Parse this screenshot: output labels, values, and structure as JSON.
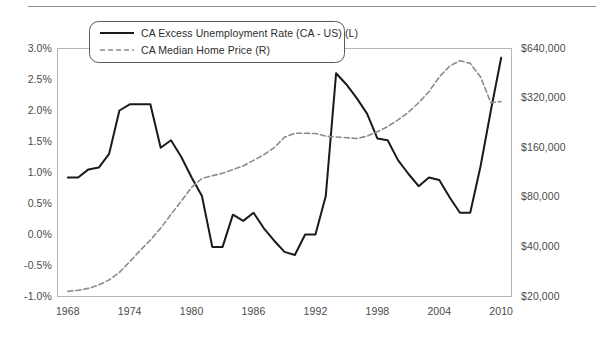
{
  "chart_data": {
    "type": "line",
    "title": "",
    "subtitle": "",
    "xlabel": "",
    "ylabel": "",
    "grid": false,
    "legend_position": "top-left",
    "x": [
      1968,
      1969,
      1970,
      1971,
      1972,
      1973,
      1974,
      1975,
      1976,
      1977,
      1978,
      1979,
      1980,
      1981,
      1982,
      1983,
      1984,
      1985,
      1986,
      1987,
      1988,
      1989,
      1990,
      1991,
      1992,
      1993,
      1994,
      1995,
      1996,
      1997,
      1998,
      1999,
      2000,
      2001,
      2002,
      2003,
      2004,
      2005,
      2006,
      2007,
      2008,
      2009,
      2010
    ],
    "xlim": [
      1967,
      2011
    ],
    "xticks": [
      1968,
      1974,
      1980,
      1986,
      1992,
      1998,
      2004,
      2010
    ],
    "xtick_labels": [
      "1968",
      "1974",
      "1980",
      "1986",
      "1992",
      "1998",
      "2004",
      "2010"
    ],
    "axes": [
      {
        "id": "left",
        "name": "CA Excess Unemployment Rate",
        "scale": "linear",
        "lim": [
          -1.0,
          3.0
        ],
        "ticks": [
          3.0,
          2.5,
          2.0,
          1.5,
          1.0,
          0.5,
          0.0,
          -0.5,
          -1.0
        ],
        "tick_labels": [
          "3.0%",
          "2.5%",
          "2.0%",
          "1.5%",
          "1.0%",
          "0.5%",
          "0.0%",
          "-0.5%",
          "-1.0%"
        ]
      },
      {
        "id": "right",
        "name": "CA Median Home Price",
        "scale": "log2",
        "lim": [
          20000,
          640000
        ],
        "ticks": [
          640000,
          320000,
          160000,
          80000,
          40000,
          20000
        ],
        "tick_labels": [
          "$640,000",
          "$320,000",
          "$160,000",
          "$80,000",
          "$40,000",
          "$20,000"
        ]
      }
    ],
    "series": [
      {
        "name": "CA Excess Unemployment Rate (CA - US) (L)",
        "axis": "left",
        "style": "solid",
        "color": "#1a1a1a",
        "width": 2.0,
        "units": "percent",
        "values": [
          0.92,
          0.92,
          1.05,
          1.08,
          1.3,
          2.0,
          2.1,
          2.1,
          2.1,
          1.4,
          1.52,
          1.25,
          0.92,
          0.62,
          -0.2,
          -0.2,
          0.32,
          0.22,
          0.35,
          0.1,
          -0.1,
          -0.28,
          -0.33,
          0.0,
          0.0,
          0.62,
          2.6,
          2.42,
          2.2,
          1.95,
          1.55,
          1.52,
          1.2,
          0.98,
          0.78,
          0.92,
          0.88,
          0.6,
          0.35,
          0.35,
          1.1,
          2.0,
          2.85
        ]
      },
      {
        "name": "CA Median Home Price (R)",
        "axis": "right",
        "style": "dashed",
        "color": "#8c8c8c",
        "width": 1.6,
        "units": "dollars",
        "values": [
          21500,
          21800,
          22400,
          23500,
          25200,
          28000,
          32500,
          38000,
          44000,
          52000,
          63000,
          76000,
          92000,
          104000,
          108000,
          112000,
          118000,
          124000,
          134000,
          145000,
          160000,
          185000,
          196000,
          196000,
          195000,
          188000,
          186000,
          184000,
          182000,
          188000,
          200000,
          215000,
          236000,
          262000,
          300000,
          350000,
          430000,
          500000,
          540000,
          520000,
          430000,
          300000,
          305000
        ]
      }
    ],
    "legend": {
      "entries": [
        {
          "label": "CA Excess Unemployment Rate (CA - US) (L)",
          "style": "solid",
          "color": "#1a1a1a"
        },
        {
          "label": "CA Median Home Price (R)",
          "style": "dashed",
          "color": "#8c8c8c"
        }
      ]
    }
  }
}
